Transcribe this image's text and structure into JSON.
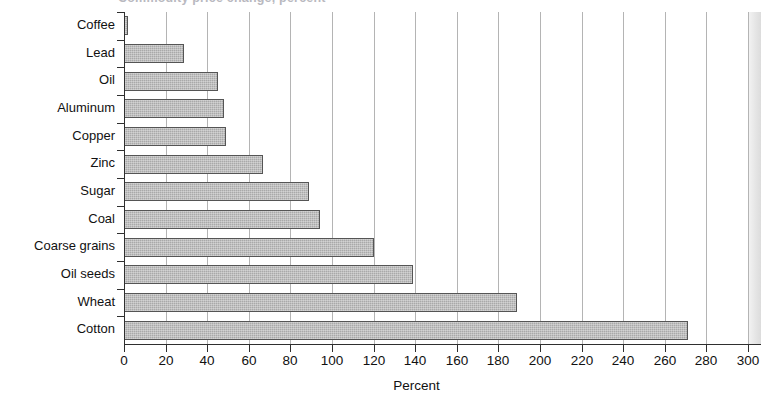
{
  "title_partial": "Commodity price change, percent",
  "chart_data": {
    "type": "bar",
    "orientation": "horizontal",
    "title": "",
    "xlabel": "Percent",
    "ylabel": "",
    "xlim": [
      0,
      300
    ],
    "xticks": [
      0,
      20,
      40,
      60,
      80,
      100,
      120,
      140,
      160,
      180,
      200,
      220,
      240,
      260,
      280,
      300
    ],
    "grid": "vertical",
    "legend": "none",
    "categories": [
      "Coffee",
      "Lead",
      "Oil",
      "Aluminum",
      "Copper",
      "Zinc",
      "Sugar",
      "Coal",
      "Coarse grains",
      "Oil seeds",
      "Wheat",
      "Cotton"
    ],
    "values": [
      2,
      29,
      45,
      48,
      49,
      67,
      89,
      94,
      120,
      139,
      189,
      271
    ],
    "bar_color": "#a9a9a9",
    "bar_edge_color": "#555555",
    "axis_color": "#2f2f2f",
    "grid_color": "#b4b4b4"
  }
}
